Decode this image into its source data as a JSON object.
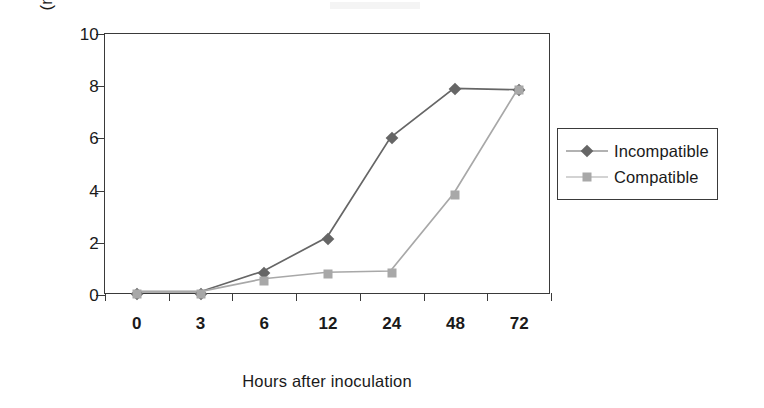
{
  "chart_data": {
    "type": "line",
    "title": "",
    "xlabel": "Hours after inoculation",
    "ylabel": "LOX activity\n(nkat mg/protein)",
    "ylabel_line1": "LOX activity",
    "ylabel_line2": "(nkat mg/protein)",
    "categories": [
      "0",
      "3",
      "6",
      "12",
      "24",
      "48",
      "72"
    ],
    "yticks": [
      "0",
      "2",
      "4",
      "6",
      "8",
      "10"
    ],
    "ylim": [
      0,
      10
    ],
    "grid": false,
    "legend_position": "right",
    "series": [
      {
        "name": "Incompatible",
        "color": "#666666",
        "marker": "diamond",
        "values": [
          0.05,
          0.05,
          0.85,
          2.15,
          6.0,
          7.9,
          7.85
        ]
      },
      {
        "name": "Compatible",
        "color": "#a8a8a8",
        "marker": "square",
        "values": [
          0.05,
          0.05,
          0.55,
          0.8,
          0.85,
          3.85,
          7.85
        ]
      }
    ]
  },
  "axes": {
    "frame_color": "#3a3a3a"
  },
  "legend": {
    "entries": [
      {
        "label": "Incompatible",
        "marker": "diamond-marker",
        "color": "#666666"
      },
      {
        "label": "Compatible",
        "marker": "square-marker",
        "color": "#a8a8a8"
      }
    ]
  }
}
